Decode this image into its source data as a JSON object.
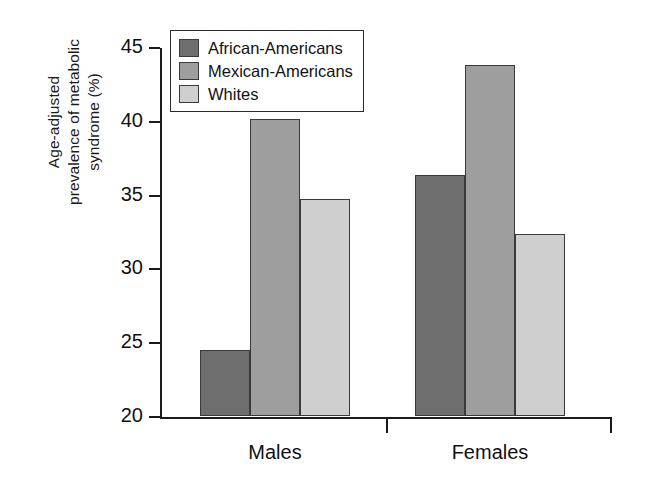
{
  "chart_data": {
    "type": "bar",
    "title": "",
    "xlabel": "",
    "ylabel_line1": "Age-adjusted",
    "ylabel_line2": "prevalence of metabolic",
    "ylabel_line3": "syndrome (%)",
    "ylabel_full": "Age-adjusted prevalence of metabolic syndrome (%)",
    "categories": [
      "Males",
      "Females"
    ],
    "ylim": [
      20,
      45
    ],
    "yticks": [
      45,
      40,
      35,
      30,
      25,
      20
    ],
    "ytick_labels": [
      "45",
      "40",
      "35",
      "30",
      "25",
      "20"
    ],
    "grid": false,
    "legend_position": "top-left-inside",
    "series": [
      {
        "name": "African-Americans",
        "color": "#6e6e6e",
        "values": [
          24.5,
          36.3
        ]
      },
      {
        "name": "Mexican-Americans",
        "color": "#9e9e9e",
        "values": [
          40.1,
          43.8
        ]
      },
      {
        "name": "Whites",
        "color": "#cfcfcf",
        "values": [
          34.7,
          32.3
        ]
      }
    ]
  },
  "legend": {
    "items": [
      {
        "label": "African-Americans",
        "color": "#6e6e6e"
      },
      {
        "label": "Mexican-Americans",
        "color": "#9e9e9e"
      },
      {
        "label": "Whites",
        "color": "#cfcfcf"
      }
    ]
  },
  "axes": {
    "y_title": {
      "line1": "Age-adjusted",
      "line2": "prevalence of metabolic",
      "line3": "syndrome (%)"
    },
    "y_ticks": [
      "45",
      "40",
      "35",
      "30",
      "25",
      "20"
    ],
    "x_groups": [
      "Males",
      "Females"
    ]
  },
  "colors": {
    "axis": "#1a1a1a",
    "bar_edge": "#3a3a3a",
    "background": "#ffffff",
    "series_dark": "#6e6e6e",
    "series_medium": "#9e9e9e",
    "series_light": "#cfcfcf"
  }
}
